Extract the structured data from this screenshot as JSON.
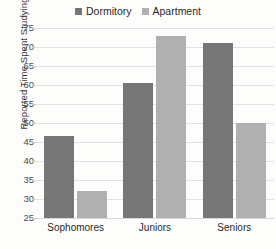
{
  "chart_data": {
    "type": "bar",
    "title": "",
    "xlabel": "",
    "ylabel": "Reported Time Spent Studying",
    "categories": [
      "Sophomores",
      "Juniors",
      "Seniors"
    ],
    "series": [
      {
        "name": "Dormitory",
        "color": "#767676",
        "values": [
          46.5,
          60.5,
          71
        ]
      },
      {
        "name": "Apartment",
        "color": "#b0b0b0",
        "values": [
          32,
          73,
          50
        ]
      }
    ],
    "ylim": [
      25,
      75
    ],
    "ytick_step": 5,
    "yticks": [
      25,
      30,
      35,
      40,
      45,
      50,
      55,
      60,
      65,
      70,
      75
    ],
    "grid": true,
    "legend_position": "top-center"
  },
  "legend": {
    "entries": [
      {
        "label": "Dormitory",
        "swatch_name": "legend-swatch-dormitory"
      },
      {
        "label": "Apartment",
        "swatch_name": "legend-swatch-apartment"
      }
    ]
  }
}
